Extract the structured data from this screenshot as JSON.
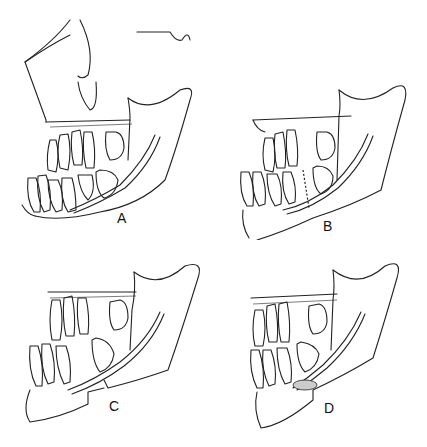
{
  "figure": {
    "type": "anatomical line drawing",
    "panels": [
      {
        "id": "A",
        "label": "A",
        "description": "Intact mandible with maxilla outline, mixed dentition and inferior alveolar canal"
      },
      {
        "id": "B",
        "label": "B",
        "description": "Mandible with dashed osteotomy line between teeth"
      },
      {
        "id": "C",
        "label": "C",
        "description": "Mandible with segmental step osteotomy displacing anterior segment"
      },
      {
        "id": "D",
        "label": "D",
        "description": "Mandible after repositioning with bone graft at canal/osteotomy site"
      }
    ]
  }
}
